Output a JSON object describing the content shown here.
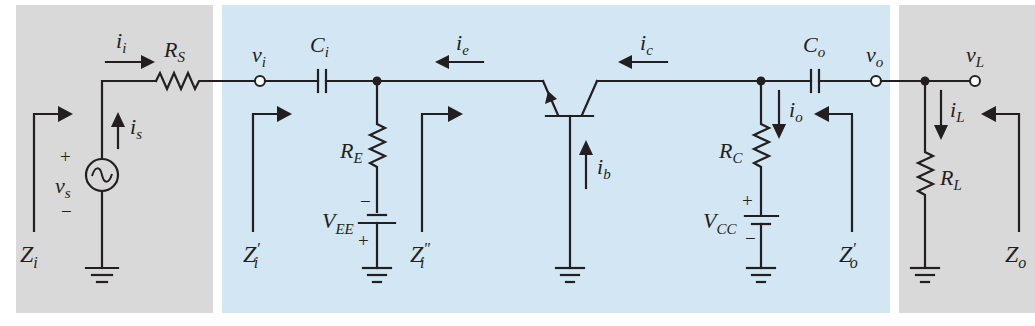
{
  "diagram": {
    "colors": {
      "source_panel": "#d8d9d8",
      "amplifier_panel": "#d3e6f4",
      "load_panel": "#d8d9d8",
      "ink": "#231f20"
    },
    "panels": [
      {
        "name": "source",
        "x": 16,
        "y": 5,
        "w": 197,
        "h": 308
      },
      {
        "name": "amplifier",
        "x": 222,
        "y": 5,
        "w": 668,
        "h": 308
      },
      {
        "name": "load",
        "x": 899,
        "y": 5,
        "w": 136,
        "h": 308
      }
    ],
    "components": {
      "source": {
        "label": "v",
        "sub": "s",
        "plus": "+",
        "minus": "−"
      },
      "rs": {
        "label": "R",
        "sub": "S"
      },
      "ci": {
        "label": "C",
        "sub": "i"
      },
      "re": {
        "label": "R",
        "sub": "E"
      },
      "vee": {
        "label": "V",
        "sub": "EE",
        "top_sign": "−",
        "bottom_sign": "+"
      },
      "transistor": {
        "type": "pnp",
        "config": "common-base"
      },
      "rc": {
        "label": "R",
        "sub": "C"
      },
      "vcc": {
        "label": "V",
        "sub": "CC",
        "top_sign": "+",
        "bottom_sign": "−"
      },
      "co": {
        "label": "C",
        "sub": "o"
      },
      "rl": {
        "label": "R",
        "sub": "L"
      }
    },
    "nodes": {
      "vi": {
        "label": "v",
        "sub": "i"
      },
      "vo": {
        "label": "v",
        "sub": "o"
      },
      "vl": {
        "label": "v",
        "sub": "L"
      }
    },
    "currents": {
      "ii": {
        "label": "i",
        "sub": "i"
      },
      "is": {
        "label": "i",
        "sub": "s"
      },
      "ie": {
        "label": "i",
        "sub": "e"
      },
      "ic": {
        "label": "i",
        "sub": "c"
      },
      "ib": {
        "label": "i",
        "sub": "b"
      },
      "io": {
        "label": "i",
        "sub": "o"
      },
      "il": {
        "label": "i",
        "sub": "L"
      }
    },
    "impedances": {
      "zi": {
        "label": "Z",
        "sub": "i",
        "prime": ""
      },
      "zi_p": {
        "label": "Z",
        "sub": "i",
        "prime": "′"
      },
      "zi_pp": {
        "label": "Z",
        "sub": "i",
        "prime": "″"
      },
      "zo_p": {
        "label": "Z",
        "sub": "o",
        "prime": "′"
      },
      "zo": {
        "label": "Z",
        "sub": "o",
        "prime": ""
      }
    }
  }
}
